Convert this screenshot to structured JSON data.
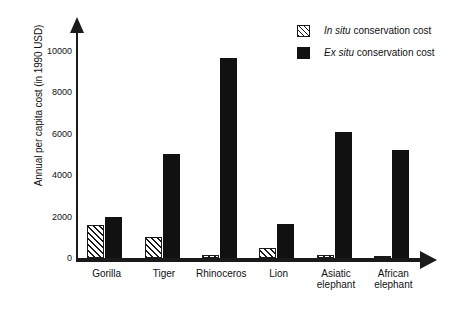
{
  "chart_data": {
    "type": "bar",
    "title": "",
    "xlabel": "",
    "ylabel": "Annual per capita cost (in 1990 USD)",
    "ylim": [
      0,
      11000
    ],
    "ytick_labels": [
      "10000",
      "8000",
      "6000",
      "4000",
      "2000",
      "0"
    ],
    "ytick_values": [
      10000,
      8000,
      6000,
      4000,
      2000,
      0
    ],
    "grid": false,
    "legend_position": "top-right",
    "categories": [
      "Gorilla",
      "Tiger",
      "Rhinoceros",
      "Lion",
      "Asiatic elephant",
      "African elephant"
    ],
    "category_lines": [
      [
        "Gorilla"
      ],
      [
        "Tiger"
      ],
      [
        "Rhinoceros"
      ],
      [
        "Lion"
      ],
      [
        "Asiatic",
        "elephant"
      ],
      [
        "African",
        "elephant"
      ]
    ],
    "series": [
      {
        "name": "In situ conservation cost",
        "name_italic_prefix": "In situ",
        "name_rest": " conservation cost",
        "pattern": "diagonal-hatch",
        "color": "#1a1a1a",
        "values": [
          1600,
          1000,
          150,
          500,
          150,
          100
        ]
      },
      {
        "name": "Ex situ conservation cost",
        "name_italic_prefix": "Ex situ",
        "name_rest": " conservation cost",
        "pattern": "solid",
        "color": "#111111",
        "values": [
          2000,
          5000,
          9650,
          1650,
          6100,
          5200
        ]
      }
    ]
  },
  "legend": {
    "items": [
      {
        "italic": "In situ",
        "rest": " conservation cost",
        "swatch": "hatched-swatch"
      },
      {
        "italic": "Ex situ",
        "rest": " conservation cost",
        "swatch": "solid-swatch"
      }
    ]
  },
  "axes": {
    "y_title": "Annual per capita cost (in 1990 USD)",
    "y_arrow": "up-arrow-icon",
    "x_arrow": "right-arrow-icon"
  }
}
